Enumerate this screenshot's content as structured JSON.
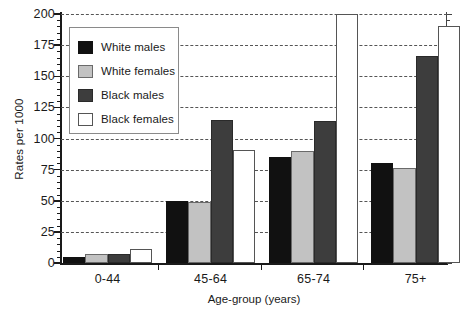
{
  "chart_data": {
    "type": "bar",
    "title": "",
    "xlabel": "Age-group (years)",
    "ylabel": "Rates per 1000",
    "categories": [
      "0-44",
      "45-64",
      "65-74",
      "75+"
    ],
    "ylim": [
      0,
      200
    ],
    "yticks": [
      0,
      25,
      50,
      75,
      100,
      125,
      150,
      175,
      200
    ],
    "ytick_labels": [
      "0",
      "25",
      "50",
      "75",
      "100",
      "125",
      "150",
      "175",
      "200"
    ],
    "y_minor_step": 5,
    "grid": "horizontal-dashed",
    "legend_position": "upper-left-inside",
    "series": [
      {
        "name": "White males",
        "color": "#111111",
        "edge": "#111111",
        "values": [
          5,
          50,
          85,
          80
        ]
      },
      {
        "name": "White females",
        "color": "#c2c2c2",
        "edge": "#6a6a6a",
        "values": [
          7,
          49,
          90,
          76
        ]
      },
      {
        "name": "Black males",
        "color": "#3d3d3d",
        "edge": "#2a2a2a",
        "values": [
          7,
          115,
          114,
          166
        ]
      },
      {
        "name": "Black females",
        "color": "#ffffff",
        "edge": "#555555",
        "values": [
          11,
          91,
          200,
          190
        ]
      }
    ]
  }
}
